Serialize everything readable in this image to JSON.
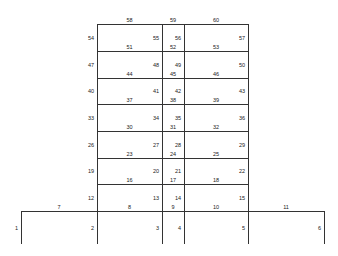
{
  "diagram": {
    "type": "structural-frame",
    "columns_x": [
      21,
      97,
      162,
      184,
      248,
      324
    ],
    "levels_y": [
      244,
      211,
      184,
      158,
      131,
      104,
      78,
      51,
      24
    ],
    "ground_columns": [
      {
        "id": "1",
        "x": 21
      },
      {
        "id": "2",
        "x": 97
      },
      {
        "id": "3",
        "x": 162
      },
      {
        "id": "4",
        "x": 184
      },
      {
        "id": "5",
        "x": 248
      },
      {
        "id": "6",
        "x": 324
      }
    ],
    "ground_beams": [
      {
        "id": "7",
        "x1": 21,
        "x2": 97
      },
      {
        "id": "8",
        "x1": 97,
        "x2": 162
      },
      {
        "id": "9",
        "x1": 162,
        "x2": 184
      },
      {
        "id": "10",
        "x1": 184,
        "x2": 248
      },
      {
        "id": "11",
        "x1": 248,
        "x2": 324
      }
    ],
    "stories": [
      {
        "columns": [
          "12",
          "13",
          "14",
          "15"
        ],
        "beams": [
          "16",
          "17",
          "18"
        ]
      },
      {
        "columns": [
          "19",
          "20",
          "21",
          "22"
        ],
        "beams": [
          "23",
          "24",
          "25"
        ]
      },
      {
        "columns": [
          "26",
          "27",
          "28",
          "29"
        ],
        "beams": [
          "30",
          "31",
          "32"
        ]
      },
      {
        "columns": [
          "33",
          "34",
          "35",
          "36"
        ],
        "beams": [
          "37",
          "38",
          "39"
        ]
      },
      {
        "columns": [
          "40",
          "41",
          "42",
          "43"
        ],
        "beams": [
          "44",
          "45",
          "46"
        ]
      },
      {
        "columns": [
          "47",
          "48",
          "49",
          "50"
        ],
        "beams": [
          "51",
          "52",
          "53"
        ]
      },
      {
        "columns": [
          "54",
          "55",
          "56",
          "57"
        ],
        "beams": [
          "58",
          "59",
          "60"
        ]
      }
    ],
    "upper_columns_x": [
      97,
      162,
      184,
      248
    ],
    "line_color": "#333333",
    "label_color": "#222222"
  }
}
